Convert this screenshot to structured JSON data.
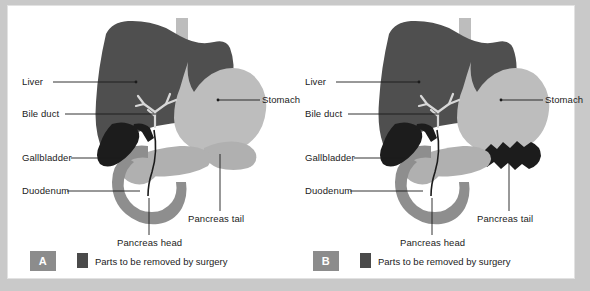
{
  "figure": {
    "kind": "medical-anatomy-diagram",
    "panel_count": 2
  },
  "colors": {
    "background": "#c9c9c9",
    "frame": "#ffffff",
    "liver": "#4f4f4f",
    "stomach": "#bdbdbd",
    "esophagus": "#bdbdbd",
    "pancreas": "#b0b0b0",
    "duodenum": "#8e8e8e",
    "gallbladder_normal": "#1c1c1c",
    "removed": "#1c1c1c",
    "bile_duct_tree": "#d8d8d8",
    "leader_line": "#1b1b1b",
    "tag_background": "#8c8c8c",
    "tag_text": "#ffffff",
    "label_text": "#1b1b1b",
    "legend_swatch": "#4a4a4a"
  },
  "panels": [
    {
      "id": "A",
      "tag": "A",
      "legend": {
        "swatch_label": "removed-parts-swatch",
        "text": "Parts to be removed by surgery"
      },
      "labels": {
        "liver": "Liver",
        "bile_duct": "Bile duct",
        "gallbladder": "Gallbladder",
        "duodenum": "Duodenum",
        "stomach": "Stomach",
        "pancreas_tail": "Pancreas tail",
        "pancreas_head": "Pancreas head"
      },
      "removed_structures": [
        "gallbladder",
        "bile duct",
        "pancreas head",
        "duodenum"
      ],
      "preserved_structures": [
        "liver",
        "stomach",
        "pancreas tail"
      ]
    },
    {
      "id": "B",
      "tag": "B",
      "legend": {
        "swatch_label": "removed-parts-swatch",
        "text": "Parts to be removed by surgery"
      },
      "labels": {
        "liver": "Liver",
        "bile_duct": "Bile duct",
        "gallbladder": "Gallbladder",
        "duodenum": "Duodenum",
        "stomach": "Stomach",
        "pancreas_tail": "Pancreas tail",
        "pancreas_head": "Pancreas head"
      },
      "removed_structures": [
        "gallbladder",
        "bile duct",
        "pancreas head",
        "duodenum",
        "pancreas tail"
      ],
      "preserved_structures": [
        "liver",
        "stomach"
      ]
    }
  ]
}
